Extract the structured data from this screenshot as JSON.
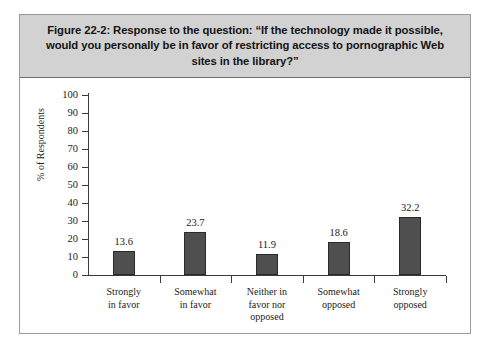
{
  "figure": {
    "title": "Figure 22-2:  Response to the question: “If the technology made it possible, would you personally be in favor of restricting access to pornographic Web sites in the library?”"
  },
  "colors": {
    "banner_background": "#d2d2d2",
    "bar_fill": "#4f4f4f",
    "bar_stroke": "#2a2a2a",
    "axis": "#3a3a3a",
    "frame": "#9a9a9a",
    "text": "#1b1b1b"
  },
  "chart_data": {
    "type": "bar",
    "title": "Figure 22-2:  Response to the question: “If the technology made it possible, would you personally be in favor of restricting access to pornographic Web sites in the library?”",
    "categories": [
      "Strongly in favor",
      "Somewhat in favor",
      "Neither in favor nor opposed",
      "Somewhat opposed",
      "Strongly opposed"
    ],
    "category_lines": [
      [
        "Strongly",
        "in favor"
      ],
      [
        "Somewhat",
        "in favor"
      ],
      [
        "Neither in",
        "favor nor",
        "opposed"
      ],
      [
        "Somewhat",
        "opposed"
      ],
      [
        "Strongly",
        "opposed"
      ]
    ],
    "values": [
      13.6,
      23.7,
      11.9,
      18.6,
      32.2
    ],
    "value_labels": [
      "13.6",
      "23.7",
      "11.9",
      "18.6",
      "32.2"
    ],
    "xlabel": "",
    "ylabel": "% of Respondents",
    "ylim": [
      0,
      100
    ],
    "ytick_step": 10,
    "yticks": [
      0,
      10,
      20,
      30,
      40,
      50,
      60,
      70,
      80,
      90,
      100
    ],
    "ytick_labels": [
      "0",
      "10",
      "20",
      "30",
      "40",
      "50",
      "60",
      "70",
      "80",
      "90",
      "100"
    ],
    "grid": false,
    "legend": null
  }
}
